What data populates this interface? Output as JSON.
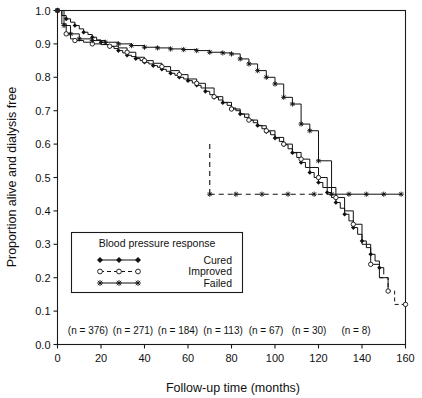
{
  "chart_data": {
    "type": "line",
    "title": "",
    "xlabel": "Follow-up time (months)",
    "ylabel": "Proportion alive and dialysis free",
    "xlim": [
      0,
      160
    ],
    "ylim": [
      0.0,
      1.0
    ],
    "xticks": [
      0,
      20,
      40,
      60,
      80,
      100,
      120,
      140,
      160
    ],
    "yticks": [
      0.0,
      0.1,
      0.2,
      0.3,
      0.4,
      0.5,
      0.6,
      0.7,
      0.8,
      0.9,
      1.0
    ],
    "xticklabels": [
      "0",
      "20",
      "40",
      "60",
      "80",
      "100",
      "120",
      "140",
      "160"
    ],
    "yticklabels": [
      "0.0",
      "0.1",
      "0.2",
      "0.3",
      "0.4",
      "0.5",
      "0.6",
      "0.7",
      "0.8",
      "0.9",
      "1.0"
    ],
    "grid": false,
    "legend_position": "lower-left-inside",
    "legend_title": "Blood pressure response",
    "series": [
      {
        "name": "Cured",
        "marker": "filled-diamond",
        "linestyle": "solid",
        "points": [
          [
            0,
            1.0
          ],
          [
            2,
            0.985
          ],
          [
            4,
            0.975
          ],
          [
            6,
            0.965
          ],
          [
            8,
            0.955
          ],
          [
            10,
            0.945
          ],
          [
            12,
            0.935
          ],
          [
            14,
            0.928
          ],
          [
            16,
            0.92
          ],
          [
            18,
            0.912
          ],
          [
            20,
            0.905
          ],
          [
            22,
            0.898
          ],
          [
            24,
            0.892
          ],
          [
            26,
            0.886
          ],
          [
            28,
            0.88
          ],
          [
            30,
            0.873
          ],
          [
            32,
            0.866
          ],
          [
            34,
            0.862
          ],
          [
            36,
            0.856
          ],
          [
            38,
            0.85
          ],
          [
            40,
            0.845
          ],
          [
            42,
            0.84
          ],
          [
            44,
            0.835
          ],
          [
            46,
            0.83
          ],
          [
            48,
            0.824
          ],
          [
            50,
            0.818
          ],
          [
            52,
            0.812
          ],
          [
            54,
            0.806
          ],
          [
            56,
            0.8
          ],
          [
            58,
            0.795
          ],
          [
            60,
            0.79
          ],
          [
            62,
            0.783
          ],
          [
            64,
            0.776
          ],
          [
            66,
            0.768
          ],
          [
            68,
            0.758
          ],
          [
            70,
            0.748
          ],
          [
            72,
            0.74
          ],
          [
            74,
            0.732
          ],
          [
            76,
            0.724
          ],
          [
            78,
            0.716
          ],
          [
            80,
            0.708
          ],
          [
            82,
            0.7
          ],
          [
            84,
            0.69
          ],
          [
            86,
            0.68
          ],
          [
            88,
            0.672
          ],
          [
            90,
            0.664
          ],
          [
            92,
            0.656
          ],
          [
            94,
            0.646
          ],
          [
            96,
            0.637
          ],
          [
            98,
            0.628
          ],
          [
            100,
            0.618
          ],
          [
            102,
            0.608
          ],
          [
            104,
            0.598
          ],
          [
            106,
            0.586
          ],
          [
            108,
            0.574
          ],
          [
            110,
            0.56
          ],
          [
            112,
            0.545
          ],
          [
            114,
            0.53
          ],
          [
            116,
            0.515
          ],
          [
            118,
            0.5
          ],
          [
            120,
            0.485
          ],
          [
            122,
            0.47
          ],
          [
            124,
            0.455
          ],
          [
            126,
            0.44
          ],
          [
            128,
            0.425
          ],
          [
            130,
            0.408
          ],
          [
            132,
            0.39
          ],
          [
            134,
            0.37
          ],
          [
            136,
            0.35
          ],
          [
            138,
            0.33
          ],
          [
            140,
            0.31
          ],
          [
            142,
            0.29
          ],
          [
            144,
            0.27
          ],
          [
            146,
            0.25
          ],
          [
            148,
            0.23
          ],
          [
            150,
            0.21
          ]
        ]
      },
      {
        "name": "Improved",
        "marker": "open-circle",
        "linestyle": "dashed",
        "points": [
          [
            0,
            1.0
          ],
          [
            2,
            0.96
          ],
          [
            4,
            0.93
          ],
          [
            6,
            0.915
          ],
          [
            8,
            0.91
          ],
          [
            12,
            0.905
          ],
          [
            16,
            0.9
          ],
          [
            20,
            0.898
          ],
          [
            24,
            0.893
          ],
          [
            28,
            0.888
          ],
          [
            32,
            0.875
          ],
          [
            36,
            0.86
          ],
          [
            40,
            0.85
          ],
          [
            44,
            0.842
          ],
          [
            48,
            0.832
          ],
          [
            52,
            0.82
          ],
          [
            56,
            0.808
          ],
          [
            60,
            0.795
          ],
          [
            64,
            0.782
          ],
          [
            68,
            0.768
          ],
          [
            72,
            0.742
          ],
          [
            76,
            0.725
          ],
          [
            80,
            0.705
          ],
          [
            84,
            0.69
          ],
          [
            88,
            0.672
          ],
          [
            92,
            0.655
          ],
          [
            96,
            0.64
          ],
          [
            100,
            0.62
          ],
          [
            104,
            0.6
          ],
          [
            108,
            0.575
          ],
          [
            112,
            0.555
          ],
          [
            116,
            0.53
          ],
          [
            120,
            0.5
          ],
          [
            124,
            0.47
          ],
          [
            128,
            0.44
          ],
          [
            132,
            0.4
          ],
          [
            136,
            0.36
          ],
          [
            140,
            0.3
          ],
          [
            144,
            0.24
          ],
          [
            148,
            0.2
          ],
          [
            152,
            0.16
          ],
          [
            155,
            0.12
          ],
          [
            160,
            0.12
          ]
        ]
      },
      {
        "name": "Failed",
        "marker": "star",
        "linestyle": "solid-step",
        "points": [
          [
            0,
            1.0
          ],
          [
            3,
            0.955
          ],
          [
            6,
            0.93
          ],
          [
            10,
            0.915
          ],
          [
            16,
            0.91
          ],
          [
            22,
            0.905
          ],
          [
            28,
            0.9
          ],
          [
            34,
            0.895
          ],
          [
            40,
            0.89
          ],
          [
            46,
            0.888
          ],
          [
            52,
            0.885
          ],
          [
            58,
            0.883
          ],
          [
            64,
            0.88
          ],
          [
            70,
            0.875
          ],
          [
            76,
            0.873
          ],
          [
            80,
            0.87
          ],
          [
            84,
            0.855
          ],
          [
            88,
            0.84
          ],
          [
            92,
            0.82
          ],
          [
            96,
            0.8
          ],
          [
            100,
            0.78
          ],
          [
            104,
            0.74
          ],
          [
            108,
            0.72
          ],
          [
            112,
            0.66
          ],
          [
            116,
            0.64
          ],
          [
            120,
            0.55
          ],
          [
            126,
            0.45
          ],
          [
            134,
            0.45
          ],
          [
            142,
            0.45
          ],
          [
            150,
            0.45
          ],
          [
            158,
            0.45
          ]
        ]
      }
    ],
    "annotations": {
      "n_labels": [
        "(n = 376)",
        "(n = 271)",
        "(n = 184)",
        "(n = 113)",
        "(n = 67)",
        "(n = 30)",
        "(n = 8)"
      ]
    }
  },
  "legend": {
    "title": "Blood pressure response",
    "entries": [
      {
        "label": "Cured",
        "marker": "filled-diamond",
        "line": "solid"
      },
      {
        "label": "Improved",
        "marker": "open-circle",
        "line": "dashed"
      },
      {
        "label": "Failed",
        "marker": "star",
        "line": "solid"
      }
    ]
  },
  "colors": {
    "ink": "#111111",
    "background": "#ffffff"
  }
}
